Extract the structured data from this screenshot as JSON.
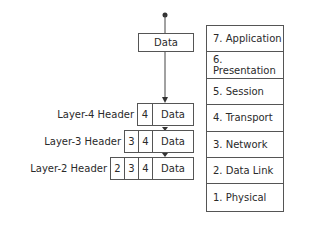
{
  "diagram": {
    "top_box": {
      "label": "Data"
    },
    "encapsulation_rows": [
      {
        "header_label": "Layer-4 Header",
        "cells": [
          "4"
        ],
        "data": "Data"
      },
      {
        "header_label": "Layer-3 Header",
        "cells": [
          "3",
          "4"
        ],
        "data": "Data"
      },
      {
        "header_label": "Layer-2 Header",
        "cells": [
          "2",
          "3",
          "4"
        ],
        "data": "Data"
      }
    ],
    "osi_layers": [
      "7. Application",
      "6. Presentation",
      "5. Session",
      "4. Transport",
      "3. Network",
      "2. Data Link",
      "1. Physical"
    ]
  }
}
